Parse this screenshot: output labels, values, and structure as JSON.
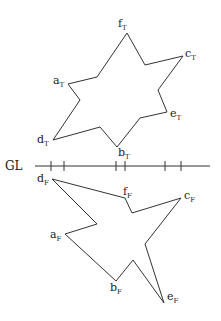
{
  "ground_line": {
    "label": "GL",
    "y": 166,
    "x_start": 35,
    "x_end": 210,
    "ticks": [
      51,
      64,
      116,
      125,
      165,
      181
    ]
  },
  "top_view": {
    "points": "127,33 145,65 183,56 158,90 167,112 140,118 117,147 100,127 53,140 80,100 68,84 97,77",
    "labels": [
      {
        "id": "fT",
        "base": "f",
        "sub": "T",
        "x": 118,
        "y": 27
      },
      {
        "id": "cT",
        "base": "c",
        "sub": "T",
        "x": 185,
        "y": 57
      },
      {
        "id": "aT",
        "base": "a",
        "sub": "T",
        "x": 53,
        "y": 84
      },
      {
        "id": "eT",
        "base": "e",
        "sub": "T",
        "x": 170,
        "y": 117
      },
      {
        "id": "dT",
        "base": "d",
        "sub": "T",
        "x": 37,
        "y": 143
      },
      {
        "id": "bT",
        "base": "b",
        "sub": "T",
        "x": 118,
        "y": 156
      }
    ]
  },
  "front_view": {
    "points": "52,179 125,198 132,213 181,198 145,244 164,303 133,260 116,281 65,234 97,224",
    "labels": [
      {
        "id": "dF",
        "base": "d",
        "sub": "F",
        "x": 37,
        "y": 182
      },
      {
        "id": "fF",
        "base": "f",
        "sub": "F",
        "x": 123,
        "y": 195
      },
      {
        "id": "cF",
        "base": "c",
        "sub": "F",
        "x": 184,
        "y": 199
      },
      {
        "id": "aF",
        "base": "a",
        "sub": "F",
        "x": 50,
        "y": 238
      },
      {
        "id": "bF",
        "base": "b",
        "sub": "F",
        "x": 110,
        "y": 291
      },
      {
        "id": "eF",
        "base": "e",
        "sub": "F",
        "x": 167,
        "y": 300
      }
    ]
  }
}
